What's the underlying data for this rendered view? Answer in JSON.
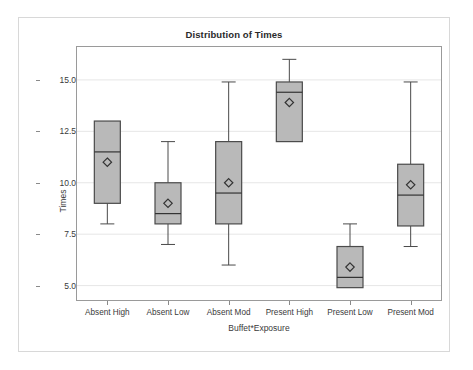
{
  "chart_data": {
    "type": "box",
    "title": "Distribution of Times",
    "xlabel": "Buffet*Exposure",
    "ylabel": "Times",
    "ylim": [
      4.3,
      16.6
    ],
    "yticks": [
      5.0,
      7.5,
      10.0,
      12.5,
      15.0
    ],
    "ytick_labels": [
      "5.0",
      "7.5",
      "10.0",
      "12.5",
      "15.0"
    ],
    "grid": true,
    "legend": "none",
    "categories": [
      "Absent High",
      "Absent Low",
      "Absent Mod",
      "Present High",
      "Present Low",
      "Present Mod"
    ],
    "boxes": [
      {
        "category": "Absent High",
        "min": 8.0,
        "q1": 9.0,
        "median": 11.5,
        "q3": 13.0,
        "max": 13.0,
        "mean": 11.0,
        "has_upper_whisker": false,
        "has_lower_whisker": true
      },
      {
        "category": "Absent Low",
        "min": 7.0,
        "q1": 8.0,
        "median": 8.5,
        "q3": 10.0,
        "max": 12.0,
        "mean": 9.0,
        "has_upper_whisker": true,
        "has_lower_whisker": true
      },
      {
        "category": "Absent Mod",
        "min": 6.0,
        "q1": 8.0,
        "median": 9.5,
        "q3": 12.0,
        "max": 14.9,
        "mean": 10.0,
        "has_upper_whisker": true,
        "has_lower_whisker": true
      },
      {
        "category": "Present High",
        "min": 12.0,
        "q1": 12.0,
        "median": 14.4,
        "q3": 14.9,
        "max": 16.0,
        "mean": 13.9,
        "has_upper_whisker": true,
        "has_lower_whisker": false
      },
      {
        "category": "Present Low",
        "min": 4.9,
        "q1": 4.9,
        "median": 5.4,
        "q3": 6.9,
        "max": 8.0,
        "mean": 5.9,
        "has_upper_whisker": true,
        "has_lower_whisker": false
      },
      {
        "category": "Present Mod",
        "min": 6.9,
        "q1": 7.9,
        "median": 9.4,
        "q3": 10.9,
        "max": 14.9,
        "mean": 9.9,
        "has_upper_whisker": true,
        "has_lower_whisker": true
      }
    ],
    "style": {
      "box_fill": "#b9b9b9",
      "box_stroke": "#4a4a4a",
      "whisker_stroke": "#4a4a4a",
      "median_stroke": "#333333",
      "mean_marker": "diamond",
      "mean_stroke": "#333333",
      "grid_color": "#e6e6e6",
      "plot_border": "#9a9a9a",
      "outer_frame": "#d8d8d8",
      "background": "#ffffff",
      "text_color": "#3a3a3a"
    }
  }
}
